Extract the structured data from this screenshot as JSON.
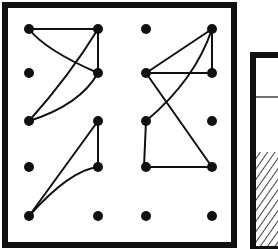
{
  "figure": {
    "colors": {
      "ink": "#111111",
      "background": "#ffffff"
    },
    "grid": {
      "columns_x": [
        29,
        98,
        146,
        212
      ],
      "rows_y": [
        29,
        73,
        121,
        167,
        216
      ]
    },
    "side_panel": {
      "hatched": true,
      "divider": true
    }
  }
}
